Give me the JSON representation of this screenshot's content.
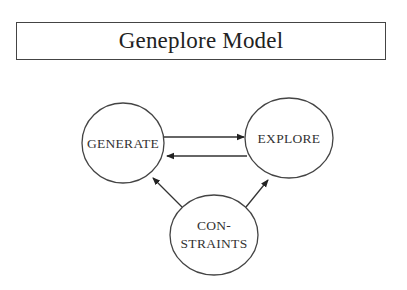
{
  "title": "Geneplore Model",
  "nodes": {
    "generate": {
      "label": "GENERATE"
    },
    "explore": {
      "label": "EXPLORE"
    },
    "constraints": {
      "line1": "CON-",
      "line2": "STRAINTS"
    }
  },
  "edges": [
    {
      "from": "GENERATE",
      "to": "EXPLORE"
    },
    {
      "from": "EXPLORE",
      "to": "GENERATE"
    },
    {
      "from": "CONSTRAINTS",
      "to": "GENERATE"
    },
    {
      "from": "CONSTRAINTS",
      "to": "EXPLORE"
    }
  ],
  "colors": {
    "stroke": "#333333",
    "background": "#ffffff"
  }
}
